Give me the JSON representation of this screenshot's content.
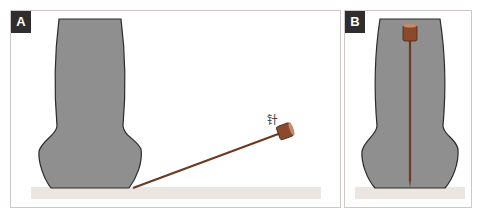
{
  "panels": [
    {
      "id": "A",
      "label": "A",
      "needle_label": "针"
    },
    {
      "id": "B",
      "label": "B"
    }
  ],
  "colors": {
    "body_fill": "#8f8f8f",
    "body_outline": "#2a2a2a",
    "needle_head": "#8b4a2b",
    "needle_shaft": "#6b3a22",
    "base": "#ece6e3",
    "badge": "#2e2e2e",
    "border": "#cfc6c6"
  }
}
